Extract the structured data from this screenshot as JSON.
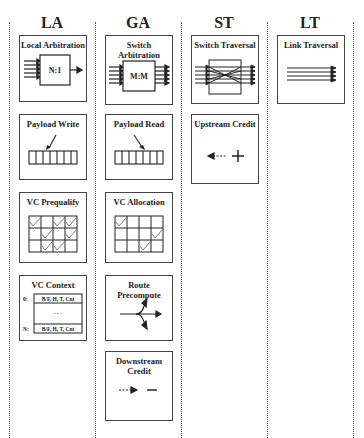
{
  "caption_fragment": "... figure showing router pipeline stage operations ...",
  "stages": [
    {
      "id": "LA",
      "title": "LA",
      "boxes": [
        {
          "id": "local-arbitration",
          "title": "Local Arbitration",
          "label": "N:1"
        },
        {
          "id": "payload-write",
          "title": "Payload Write"
        },
        {
          "id": "vc-prequalify",
          "title": "VC Prequalify"
        },
        {
          "id": "vc-context",
          "title": "VC Context",
          "rows": [
            "0:",
            "N:"
          ],
          "row_text": "B/F, H, T, Cnt",
          "ellipsis": "· · ·"
        }
      ]
    },
    {
      "id": "GA",
      "title": "GA",
      "boxes": [
        {
          "id": "switch-arbitration",
          "title": "Switch Arbitration",
          "label": "M:M"
        },
        {
          "id": "payload-read",
          "title": "Payload Read"
        },
        {
          "id": "vc-allocation",
          "title": "VC Allocation"
        },
        {
          "id": "route-precompute",
          "title": "Route Precompute"
        },
        {
          "id": "downstream-credit",
          "title": "Downstream Credit",
          "symbol": "—"
        }
      ]
    },
    {
      "id": "ST",
      "title": "ST",
      "boxes": [
        {
          "id": "switch-traversal",
          "title": "Switch Traversal"
        },
        {
          "id": "upstream-credit",
          "title": "Upstream Credit",
          "symbol": "+"
        }
      ]
    },
    {
      "id": "LT",
      "title": "LT",
      "boxes": [
        {
          "id": "link-traversal",
          "title": "Link Traversal"
        }
      ]
    }
  ]
}
